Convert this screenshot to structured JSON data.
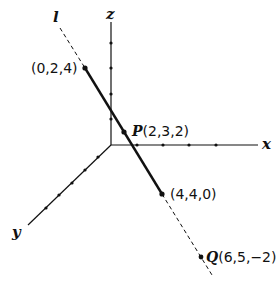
{
  "diagram": {
    "axes": {
      "x_label": "x",
      "y_label": "y",
      "z_label": "z"
    },
    "line": {
      "label": "l"
    },
    "points": [
      {
        "name": "",
        "coords": "(0,2,4)"
      },
      {
        "name": "P",
        "coords": "(2,3,2)"
      },
      {
        "name": "",
        "coords": "(4,4,0)"
      },
      {
        "name": "Q",
        "coords": "(6,5,−2)"
      }
    ]
  }
}
